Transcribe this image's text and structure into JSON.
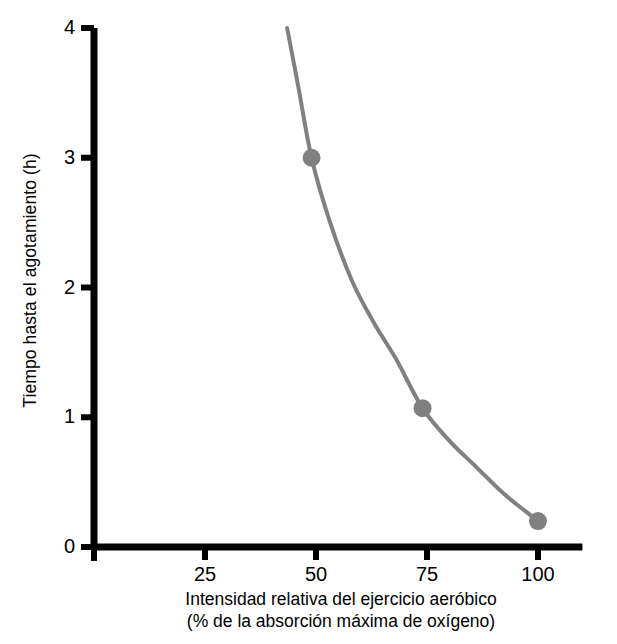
{
  "chart_data": {
    "type": "line",
    "title": "",
    "subtitle": "",
    "xlabel_line1": "Intensidad relativa del ejercicio aeróbico",
    "xlabel_line2": "(% de la absorción máxima de oxígeno)",
    "ylabel": "Tiempo hasta el agotamiento (h)",
    "xlim": [
      0,
      110
    ],
    "ylim": [
      0,
      4
    ],
    "grid": false,
    "legend": "none",
    "x_ticks": [
      {
        "value": 25,
        "label": "25"
      },
      {
        "value": 50,
        "label": "50"
      },
      {
        "value": 75,
        "label": "75"
      },
      {
        "value": 100,
        "label": "100"
      }
    ],
    "y_ticks": [
      {
        "value": 0,
        "label": "0"
      },
      {
        "value": 1,
        "label": "1"
      },
      {
        "value": 2,
        "label": "2"
      },
      {
        "value": 3,
        "label": "3"
      },
      {
        "value": 4,
        "label": "4"
      }
    ],
    "series": [
      {
        "name": "Tiempo hasta el agotamiento",
        "color": "#808080",
        "line_width_px": 4,
        "x": [
          43.5,
          46,
          49,
          53,
          58,
          63,
          68,
          74,
          80,
          86,
          92,
          97,
          100
        ],
        "y": [
          4.0,
          3.55,
          3.0,
          2.52,
          2.06,
          1.73,
          1.45,
          1.07,
          0.82,
          0.62,
          0.42,
          0.28,
          0.2
        ]
      }
    ],
    "markers": [
      {
        "x": 49,
        "y": 3.0,
        "label": "49, 3.0"
      },
      {
        "x": 74,
        "y": 1.07,
        "label": "74, 1.07"
      },
      {
        "x": 100,
        "y": 0.2,
        "label": "100, 0.2"
      }
    ],
    "marker_color": "#808080",
    "marker_radius_px": 9,
    "axis_color": "#000000",
    "background_color": "#ffffff"
  }
}
